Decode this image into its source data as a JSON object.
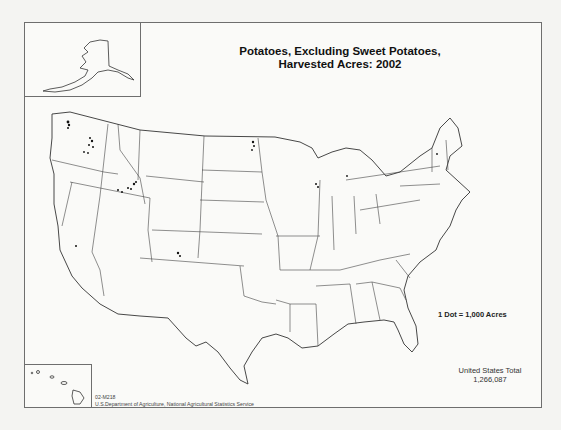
{
  "map": {
    "title_line1": "Potatoes, Excluding Sweet Potatoes,",
    "title_line2": "Harvested Acres:  2002",
    "legend": "1 Dot = 1,000 Acres",
    "total_label": "United States Total",
    "total_value": "1,266,087",
    "map_id": "02-M218",
    "source": "U.S.Department of Agriculture, National Agricultural Statistics Service",
    "insets": [
      "Alaska",
      "Hawaii"
    ],
    "colors": {
      "boundary": "#333333",
      "dot": "#111111",
      "background": "#fafaf8"
    }
  }
}
